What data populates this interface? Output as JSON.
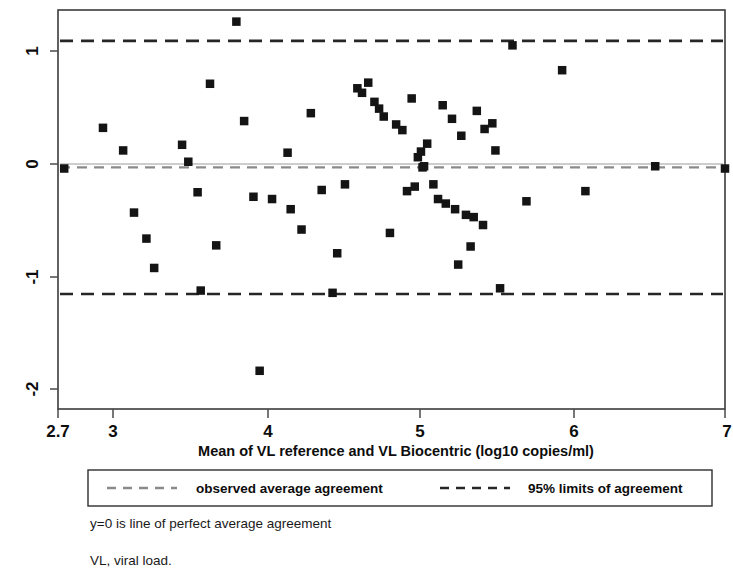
{
  "figure": {
    "kind": "bland-altman-plot"
  },
  "axes": {
    "x_title": "Mean of VL reference and VL Biocentric (log10 copies/ml)",
    "x_ticks": [
      "2.7",
      "3",
      "4",
      "5",
      "6",
      "7"
    ],
    "y_ticks": [
      "1",
      "0",
      "-1",
      "-2"
    ]
  },
  "legend": {
    "observed_label": "observed average agreement",
    "limits_label": "95% limits of agreement",
    "observed_color": "#8a8a8a",
    "limits_color": "#262626"
  },
  "notes": {
    "line1": "y=0 is line of perfect average agreement",
    "line2": "VL, viral load."
  },
  "chart_data": {
    "type": "scatter",
    "title": "",
    "xlabel": "Mean of VL reference and VL Biocentric (log10 copies/ml)",
    "ylabel": "",
    "xlim": [
      2.7,
      7.0
    ],
    "ylim": [
      -2.35,
      1.4
    ],
    "xticks": [
      2.7,
      3,
      4,
      5,
      6,
      7
    ],
    "yticks": [
      1,
      0,
      -1,
      -2
    ],
    "grid": false,
    "legend_position": "below-axes",
    "reference_lines": [
      {
        "name": "observed average agreement",
        "y": -0.03,
        "style": "dashed",
        "color": "#8a8a8a"
      },
      {
        "name": "95% upper limit of agreement",
        "y": 1.09,
        "style": "dashed",
        "color": "#262626"
      },
      {
        "name": "95% lower limit of agreement",
        "y": -1.15,
        "style": "dashed",
        "color": "#262626"
      }
    ],
    "series": [
      {
        "name": "VL reference vs VL Biocentric difference",
        "marker": "square",
        "color": "#141414",
        "points": [
          [
            2.74,
            -0.04
          ],
          [
            2.99,
            0.32
          ],
          [
            3.12,
            0.12
          ],
          [
            3.19,
            -0.43
          ],
          [
            3.27,
            -0.66
          ],
          [
            3.32,
            -0.92
          ],
          [
            3.5,
            0.17
          ],
          [
            3.54,
            0.02
          ],
          [
            3.6,
            -0.25
          ],
          [
            3.62,
            -1.12
          ],
          [
            3.68,
            0.71
          ],
          [
            3.72,
            -0.72
          ],
          [
            3.85,
            1.26
          ],
          [
            3.9,
            0.38
          ],
          [
            3.96,
            -0.29
          ],
          [
            4.0,
            -1.83
          ],
          [
            4.08,
            -0.31
          ],
          [
            4.18,
            0.1
          ],
          [
            4.2,
            -0.4
          ],
          [
            4.27,
            -0.58
          ],
          [
            4.33,
            0.45
          ],
          [
            4.4,
            -0.23
          ],
          [
            4.47,
            -1.14
          ],
          [
            4.5,
            -0.79
          ],
          [
            4.55,
            -0.18
          ],
          [
            4.63,
            0.67
          ],
          [
            4.66,
            0.63
          ],
          [
            4.7,
            0.72
          ],
          [
            4.74,
            0.55
          ],
          [
            4.77,
            0.49
          ],
          [
            4.8,
            0.42
          ],
          [
            4.84,
            -0.61
          ],
          [
            4.88,
            0.35
          ],
          [
            4.92,
            0.3
          ],
          [
            4.95,
            -0.24
          ],
          [
            4.98,
            0.58
          ],
          [
            5.0,
            -0.2
          ],
          [
            5.02,
            0.06
          ],
          [
            5.04,
            0.11
          ],
          [
            5.05,
            -0.03
          ],
          [
            5.06,
            -0.02
          ],
          [
            5.08,
            0.18
          ],
          [
            5.12,
            -0.18
          ],
          [
            5.15,
            -0.31
          ],
          [
            5.18,
            0.52
          ],
          [
            5.2,
            -0.35
          ],
          [
            5.24,
            0.4
          ],
          [
            5.26,
            -0.4
          ],
          [
            5.28,
            -0.89
          ],
          [
            5.3,
            0.25
          ],
          [
            5.33,
            -0.45
          ],
          [
            5.36,
            -0.73
          ],
          [
            5.38,
            -0.47
          ],
          [
            5.4,
            0.47
          ],
          [
            5.44,
            -0.54
          ],
          [
            5.45,
            0.31
          ],
          [
            5.5,
            0.36
          ],
          [
            5.52,
            0.12
          ],
          [
            5.55,
            -1.1
          ],
          [
            5.63,
            1.05
          ],
          [
            5.72,
            -0.33
          ],
          [
            5.95,
            0.83
          ],
          [
            6.1,
            -0.24
          ],
          [
            6.55,
            -0.02
          ],
          [
            7.0,
            -0.04
          ]
        ]
      }
    ]
  }
}
